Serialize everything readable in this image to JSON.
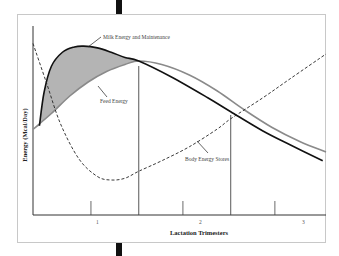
{
  "chart_data": {
    "type": "line",
    "title": "",
    "xlabel": "Lactation Trimesters",
    "ylabel": "Energy (Mcal/Day)",
    "xlim": [
      0,
      3.2
    ],
    "ylim": [
      0,
      1
    ],
    "x_ticks": [
      "1",
      "2",
      "3"
    ],
    "x_tick_values": [
      0.63,
      1.63,
      2.63
    ],
    "trimester_boundaries": [
      1.15,
      2.15
    ],
    "grid": false,
    "series": [
      {
        "name": "Milk Energy and Maintenance",
        "style": "solid-black",
        "x": [
          0.07,
          0.12,
          0.2,
          0.32,
          0.45,
          0.55,
          0.7,
          0.85,
          1.0,
          1.15,
          1.5,
          1.9,
          2.15,
          2.5,
          2.8,
          3.15
        ],
        "y": [
          0.51,
          0.7,
          0.85,
          0.93,
          0.96,
          0.965,
          0.955,
          0.93,
          0.9,
          0.88,
          0.79,
          0.67,
          0.59,
          0.48,
          0.4,
          0.31
        ]
      },
      {
        "name": "Feed Energy",
        "style": "solid-gray",
        "x": [
          0.0,
          0.2,
          0.4,
          0.6,
          0.8,
          1.0,
          1.15,
          1.4,
          1.7,
          2.0,
          2.3,
          2.6,
          2.9,
          3.2
        ],
        "y": [
          0.49,
          0.58,
          0.68,
          0.76,
          0.82,
          0.86,
          0.88,
          0.86,
          0.8,
          0.71,
          0.6,
          0.5,
          0.42,
          0.36
        ]
      },
      {
        "name": "Body Energy Stores",
        "style": "dashed-black",
        "x": [
          0.0,
          0.15,
          0.3,
          0.5,
          0.7,
          0.85,
          1.0,
          1.15,
          1.4,
          1.7,
          2.0,
          2.15,
          2.5,
          2.8,
          3.2
        ],
        "y": [
          0.98,
          0.75,
          0.52,
          0.32,
          0.22,
          0.2,
          0.21,
          0.25,
          0.31,
          0.39,
          0.49,
          0.55,
          0.67,
          0.78,
          0.92
        ]
      }
    ],
    "shaded_region": {
      "between": [
        "Milk Energy and Maintenance",
        "Feed Energy"
      ],
      "x_range": [
        0.0,
        1.15
      ],
      "color": "#b4b4b4"
    },
    "annotations": [
      {
        "text": "Milk Energy and Maintenance",
        "points_to": "Milk Energy and Maintenance"
      },
      {
        "text": "Feed Energy",
        "points_to": "Feed Energy"
      },
      {
        "text": "Body Energy Stores",
        "points_to": "Body Energy Stores"
      }
    ]
  }
}
